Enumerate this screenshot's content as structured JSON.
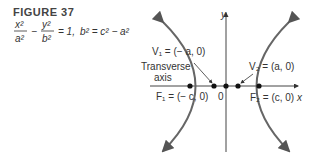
{
  "figure": {
    "title": "FIGURE 37",
    "equation_text": "x²/a² − y²/b² = 1, b² = c² − a²"
  },
  "labels": {
    "y_axis": "y",
    "x_axis": "x",
    "origin": "0",
    "v1": "V₁ = (− a, 0)",
    "v2": "V₂ = (a, 0)",
    "f1": "F₁ = (− c, 0)",
    "f2": "F₂ = (c, 0)",
    "transverse_line1": "Transverse",
    "transverse_line2": "axis"
  }
}
